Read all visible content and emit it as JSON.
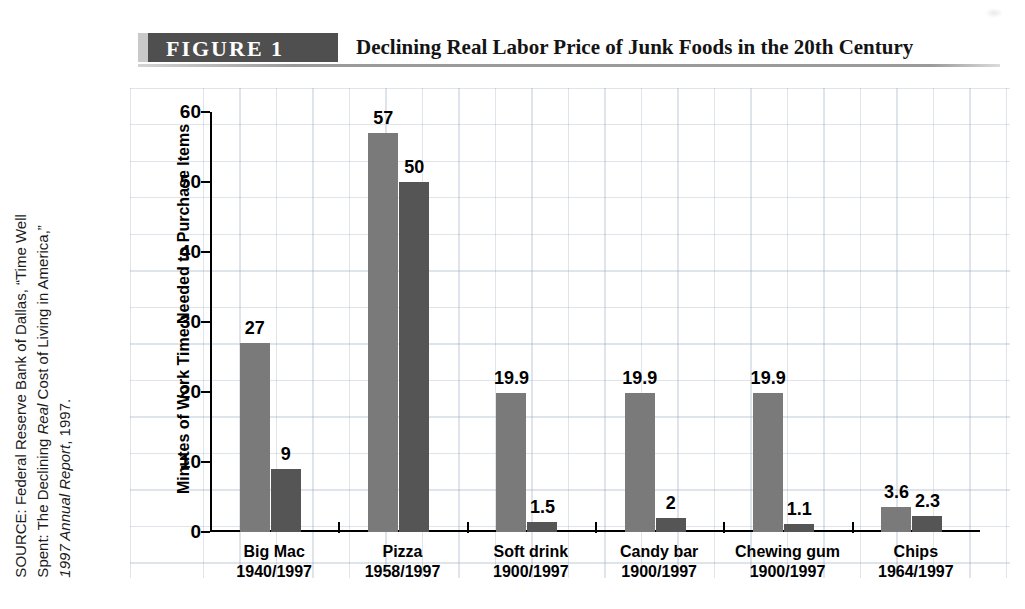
{
  "figure": {
    "badge_label": "FIGURE  1",
    "title": "Declining Real Labor Price of Junk Foods in the 20th Century"
  },
  "source_note": {
    "line1": "SOURCE: Federal Reserve Bank of Dallas, “Time Well",
    "line2_a": "Spent: The Declining ",
    "line2_italic1": "Real",
    "line2_b": " Cost of Living in America,”",
    "line3_italic": "1997 Annual Report",
    "line3_b": ", 1997."
  },
  "chart_data": {
    "type": "bar",
    "title": "Declining Real Labor Price of Junk Foods in the 20th Century",
    "xlabel": "",
    "ylabel": "Minutes of Work Time Needed to Purchase Items",
    "ylim": [
      0,
      60
    ],
    "yticks": [
      0,
      10,
      20,
      30,
      40,
      50,
      60
    ],
    "ytick_labels": [
      "0",
      "10",
      "20",
      "30",
      "40",
      "50",
      "60"
    ],
    "grid": true,
    "legend": "none",
    "categories": [
      "Big Mac",
      "Pizza",
      "Soft drink",
      "Candy bar",
      "Chewing gum",
      "Chips"
    ],
    "category_years": [
      "1940/1997",
      "1958/1997",
      "1900/1997",
      "1900/1997",
      "1900/1997",
      "1964/1997"
    ],
    "series": [
      {
        "name": "Earlier year",
        "color": "#7a7a7a",
        "values": [
          27,
          57,
          19.9,
          19.9,
          19.9,
          3.6
        ],
        "labels": [
          "27",
          "57",
          "19.9",
          "19.9",
          "19.9",
          "3.6"
        ]
      },
      {
        "name": "1997",
        "color": "#555555",
        "values": [
          9,
          50,
          1.5,
          2,
          1.1,
          2.3
        ],
        "labels": [
          "9",
          "50",
          "1.5",
          "2",
          "1.1",
          "2.3"
        ]
      }
    ]
  },
  "colors": {
    "bar_light": "#7a7a7a",
    "bar_dark": "#555555",
    "axis": "#000000",
    "badge": "#4f4f4f",
    "grid": "#96a5be"
  }
}
